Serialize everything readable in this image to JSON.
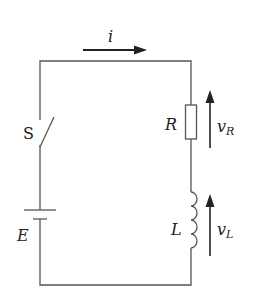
{
  "diagram": {
    "type": "RL series circuit",
    "labels": {
      "current": "i",
      "switch": "S",
      "source": "E",
      "resistor": "R",
      "inductor": "L",
      "v_resistor_main": "v",
      "v_resistor_sub": "R",
      "v_inductor_main": "v",
      "v_inductor_sub": "L"
    },
    "colors": {
      "wire": "#555555",
      "arrow": "#222222",
      "text": "#222222",
      "background": "#ffffff"
    }
  }
}
